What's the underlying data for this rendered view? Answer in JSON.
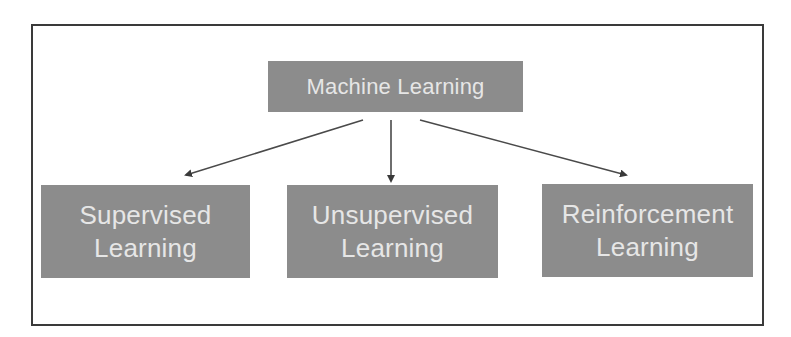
{
  "diagram": {
    "type": "tree",
    "root": {
      "label": "Machine Learning"
    },
    "children": [
      {
        "line1": "Supervised",
        "line2": "Learning"
      },
      {
        "line1": "Unsupervised",
        "line2": "Learning"
      },
      {
        "line1": "Reinforcement",
        "line2": "Learning"
      }
    ],
    "edges": [
      {
        "from": "Machine Learning",
        "to": "Supervised Learning"
      },
      {
        "from": "Machine Learning",
        "to": "Unsupervised Learning"
      },
      {
        "from": "Machine Learning",
        "to": "Reinforcement Learning"
      }
    ],
    "colors": {
      "node_fill": "#8c8c8c",
      "node_text": "#e6e6e6",
      "arrow": "#3a3a3a",
      "frame": "#3a3a3a",
      "background": "#ffffff"
    }
  }
}
